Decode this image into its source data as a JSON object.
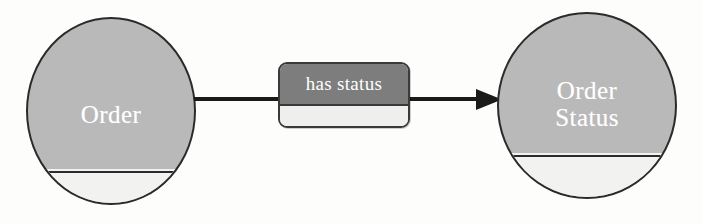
{
  "diagram": {
    "type": "entity-relationship-diagram",
    "title": "Order has status Order Status",
    "background_color": "#fdfdfb",
    "entities": [
      {
        "id": "order",
        "label": "Order",
        "label_lines": [
          "Order"
        ],
        "shape": "circle",
        "fill_color": "#b9b9b9",
        "lower_compartment_color": "#f2f2f0",
        "outline_color": "#2b2b2b",
        "text_color": "#ffffff"
      },
      {
        "id": "order-status",
        "label": "Order Status",
        "label_lines": [
          "Order",
          "Status"
        ],
        "shape": "circle",
        "fill_color": "#b9b9b9",
        "lower_compartment_color": "#f2f2f0",
        "outline_color": "#2b2b2b",
        "text_color": "#ffffff"
      }
    ],
    "relationship": {
      "label": "has status",
      "from": "Order",
      "to": "Order Status",
      "direction": "left-to-right",
      "arrowhead": "solid-filled",
      "header_color": "#7d7d7d",
      "body_color": "#efefee",
      "outline_color": "#3a3a3a",
      "text_color": "#ffffff",
      "line_color": "#1a1a1a"
    }
  }
}
